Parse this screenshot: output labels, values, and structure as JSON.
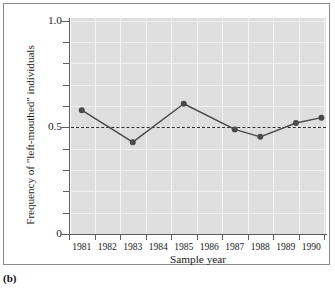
{
  "figure": {
    "panel_caption": "(b)"
  },
  "chart_data": {
    "type": "line",
    "title": "",
    "xlabel": "Sample year",
    "ylabel": "Frequency of \"left-mouthed\" individuals",
    "xlim": [
      1981,
      1991
    ],
    "ylim": [
      0,
      1.0
    ],
    "grid": true,
    "legend_position": "none",
    "y_ticks_major": [
      {
        "value": 0,
        "label": "0"
      },
      {
        "value": 0.5,
        "label": "0.5"
      },
      {
        "value": 1.0,
        "label": "1.0"
      }
    ],
    "y_ticks_minor": [
      0.1,
      0.2,
      0.3,
      0.4,
      0.6,
      0.7,
      0.8,
      0.9
    ],
    "x_tick_labels": [
      "1981",
      "1982",
      "1983",
      "1984",
      "1985",
      "1986",
      "1987",
      "1988",
      "1989",
      "1990"
    ],
    "x_tick_values": [
      1981,
      1982,
      1983,
      1984,
      1985,
      1986,
      1987,
      1988,
      1989,
      1990,
      1991
    ],
    "reference_line": {
      "value": 0.5,
      "style": "dashed",
      "color": "#2a2a2a"
    },
    "series": [
      {
        "name": "Frequency of left-mouthed individuals",
        "color": "#4a4a4a",
        "marker": "circle",
        "x": [
          1981.5,
          1983.5,
          1985.5,
          1987.5,
          1988.5,
          1989.9,
          1990.9
        ],
        "values": [
          0.58,
          0.43,
          0.61,
          0.49,
          0.455,
          0.52,
          0.545
        ]
      }
    ]
  },
  "colors": {
    "panel_background": "#dedede",
    "gridline": "#f2f2f2",
    "axis": "#5d5d5d",
    "series": "#4a4a4a",
    "frame_border": "#8a8a8a"
  }
}
